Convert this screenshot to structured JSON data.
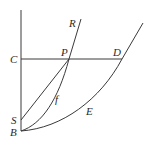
{
  "diagram": {
    "type": "geometry-curves",
    "labels": {
      "R": "R",
      "P": "P",
      "D": "D",
      "C": "C",
      "S": "S",
      "B": "B",
      "f": "f",
      "E": "E"
    },
    "colors": {
      "stroke": "#3a3a3a",
      "text": "#2a2a2a",
      "background": "#ffffff"
    },
    "points": {
      "B": [
        21,
        131
      ],
      "S": [
        21,
        120
      ],
      "C": [
        21,
        59
      ],
      "P": [
        69,
        59
      ],
      "D": [
        122,
        59
      ],
      "R_top": [
        81,
        19
      ],
      "E_top": [
        143,
        23
      ]
    },
    "elements": [
      "vertical axis through C, S, B",
      "horizontal segment C–P–D",
      "straight segment S–P",
      "curve f from B to P continuing to R",
      "curve E from B through D"
    ]
  }
}
